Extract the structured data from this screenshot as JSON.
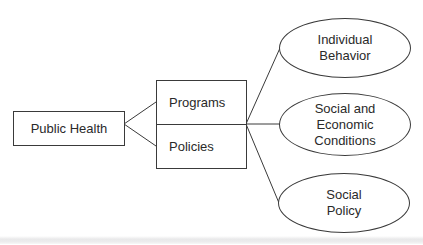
{
  "diagram": {
    "type": "hierarchy",
    "root": {
      "label": "Public Health"
    },
    "middle": {
      "items": [
        {
          "label": "Programs"
        },
        {
          "label": "Policies"
        }
      ]
    },
    "targets": [
      {
        "lines": [
          "Individual",
          "Behavior"
        ]
      },
      {
        "lines": [
          "Social and",
          "Economic",
          "Conditions"
        ]
      },
      {
        "lines": [
          "Social",
          "Policy"
        ]
      }
    ],
    "colors": {
      "stroke": "#3a3a3a",
      "text": "#2a2a2a",
      "background": "#ffffff"
    }
  }
}
